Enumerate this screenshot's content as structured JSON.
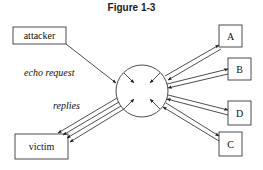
{
  "title": "Figure 1-3",
  "nodes": {
    "attacker": {
      "label": "attacker"
    },
    "victim": {
      "label": "victim"
    },
    "a": {
      "label": "A"
    },
    "b": {
      "label": "B"
    },
    "c": {
      "label": "C"
    },
    "d": {
      "label": "D"
    }
  },
  "edge_labels": {
    "echo_request": "echo request",
    "replies": "replies"
  },
  "colors": {
    "stroke": "#222222",
    "background": "#ffffff"
  }
}
